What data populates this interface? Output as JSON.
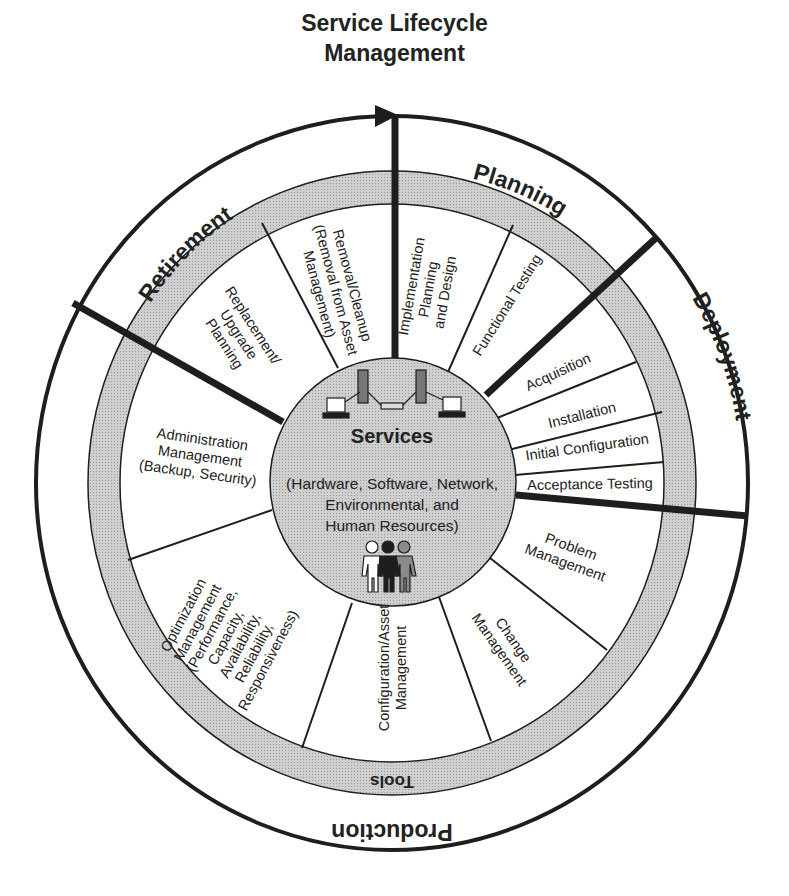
{
  "title": {
    "line1": "Service Lifecycle",
    "line2": "Management"
  },
  "phases": {
    "planning": "Planning",
    "deployment": "Deployment",
    "production": "Production",
    "retirement": "Retirement"
  },
  "tools_ring": {
    "label": "Tools"
  },
  "services": {
    "title": "Services",
    "subtitle_lines": [
      "(Hardware, Software, Network,",
      "Environmental, and",
      "Human Resources)"
    ],
    "icons": [
      "computer-network-icon",
      "people-icon"
    ]
  },
  "activities": {
    "planning": [
      {
        "lines": [
          "Implementation",
          "Planning",
          "and Design"
        ]
      },
      {
        "lines": [
          "Functional Testing"
        ]
      }
    ],
    "deployment": [
      {
        "lines": [
          "Acquisition"
        ]
      },
      {
        "lines": [
          "Installation"
        ]
      },
      {
        "lines": [
          "Initial Configuration"
        ]
      },
      {
        "lines": [
          "Acceptance Testing"
        ]
      }
    ],
    "production": [
      {
        "lines": [
          "Problem",
          "Management"
        ]
      },
      {
        "lines": [
          "Change",
          "Management"
        ]
      },
      {
        "lines": [
          "Configuration/Asset",
          "Management"
        ]
      },
      {
        "lines": [
          "Optimization",
          "Management",
          "(Performance,",
          "Capacity,",
          "Availability,",
          "Reliability,",
          "Responsiveness)"
        ]
      },
      {
        "lines": [
          "Administration",
          "Management",
          "(Backup, Security)"
        ]
      }
    ],
    "retirement": [
      {
        "lines": [
          "Replacement/",
          "Upgrade",
          "Planning"
        ]
      },
      {
        "lines": [
          "Removal/Cleanup",
          "(Removal from Asset",
          "Management)"
        ]
      }
    ]
  },
  "colors": {
    "line": "#1e1e1e",
    "tools_band": "#c4c4c4",
    "services_fill": "#c8c8c8",
    "background": "#ffffff"
  }
}
